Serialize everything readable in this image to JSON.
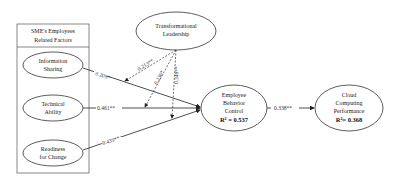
{
  "group_box": {
    "title_line1": "SME's Employees",
    "title_line2": "Related Factors"
  },
  "nodes": {
    "information_sharing": {
      "line1": "Information",
      "line2": "Sharing"
    },
    "technical_ability": {
      "line1": "Technical",
      "line2": "Ability"
    },
    "readiness_for_change": {
      "line1": "Readiness",
      "line2": "for Change"
    },
    "transformational_leadership": {
      "line1": "Transformational",
      "line2": "Leadership"
    },
    "employee_behavior_control": {
      "line1": "Employee",
      "line2": "Behavior",
      "line3": "Control",
      "r2": "R² = 0.537"
    },
    "cloud_computing_performance": {
      "line1": "Cloud",
      "line2": "Computing",
      "line3": "Performance",
      "r2": "R²= 0.368"
    }
  },
  "paths": {
    "info_to_ebc": "0.209*",
    "tech_to_ebc": "0.461**",
    "rfc_to_ebc": "0.439**",
    "tl_mod_info": "0.213**",
    "tl_mod_tech": "0.236*",
    "tl_mod_rfc": "0.349**",
    "ebc_to_ccp": "0.338**"
  }
}
